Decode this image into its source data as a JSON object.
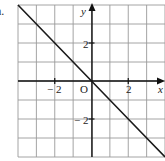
{
  "figure": {
    "label": "a.",
    "axis_x_label": "x",
    "axis_y_label": "y",
    "origin_label": "O",
    "x_tick_labels": [
      {
        "value": -2,
        "text": "− 2"
      },
      {
        "value": 2,
        "text": "2"
      }
    ],
    "y_tick_labels": [
      {
        "value": 2,
        "text": "2"
      },
      {
        "value": -2,
        "text": "− 2"
      }
    ]
  },
  "chart_data": {
    "type": "line",
    "title": "",
    "xlabel": "x",
    "ylabel": "y",
    "xlim": [
      -4,
      4
    ],
    "ylim": [
      -4,
      4
    ],
    "grid": true,
    "grid_step": 1,
    "x_ticks_labeled": [
      -2,
      2
    ],
    "y_ticks_labeled": [
      -2,
      2
    ],
    "series": [
      {
        "name": "y = -x",
        "x": [
          -4,
          -2,
          0,
          2,
          4
        ],
        "y": [
          4,
          2,
          0,
          -2,
          -4
        ]
      }
    ],
    "annotations": [
      "O"
    ],
    "colors": {
      "line": "#1a1a1a",
      "grid": "#9a9a9a",
      "axis": "#111111"
    }
  }
}
